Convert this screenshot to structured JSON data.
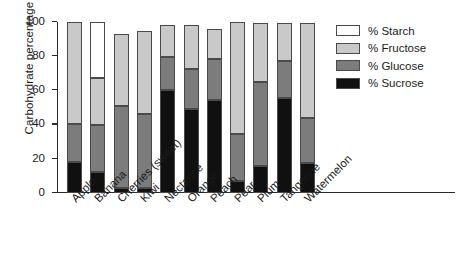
{
  "chart_data": {
    "type": "bar",
    "subtype": "stacked-bar",
    "title": "",
    "xlabel": "",
    "ylabel": "Carbohydrate percentage",
    "ylim": [
      0,
      100
    ],
    "yticks": [
      0,
      20,
      40,
      60,
      80,
      100
    ],
    "ytick_labels": [
      "0",
      "20",
      "40",
      "60",
      "80",
      "100"
    ],
    "grid": false,
    "legend_position": "right",
    "categories": [
      "Apple",
      "Banana",
      "Cherries (sweet)",
      "Kiwi",
      "Nectarine",
      "Orange",
      "Peach",
      "Pear",
      "Plum",
      "Tangerine",
      "Watermelon"
    ],
    "series": [
      {
        "name": "% Sucrose",
        "color": "#101010",
        "values": [
          18,
          12,
          3,
          3,
          60.5,
          49,
          54.5,
          7,
          16,
          55.5,
          17.5
        ]
      },
      {
        "name": "% Glucose",
        "color": "#7c7c7c",
        "values": [
          22.5,
          27.5,
          48,
          43,
          19,
          23.5,
          24,
          27.5,
          49,
          21.5,
          26.5
        ]
      },
      {
        "name": "% Fructose",
        "color": "#c9c9c9",
        "values": [
          59.5,
          27.5,
          42,
          48.5,
          19,
          26,
          17.5,
          65.5,
          34.5,
          22.5,
          55.5
        ]
      },
      {
        "name": "% Starch",
        "color": "#ffffff",
        "values": [
          0,
          33,
          0,
          0,
          0,
          0,
          0,
          0,
          0,
          0,
          0
        ]
      }
    ],
    "cumulative_tops": {
      "Apple": {
        "sucrose": 18,
        "glucose": 40.5,
        "fructose": 100,
        "starch": 100
      },
      "Banana": {
        "sucrose": 12,
        "glucose": 39.5,
        "fructose": 67,
        "starch": 100
      },
      "Cherries (sweet)": {
        "sucrose": 3,
        "glucose": 51,
        "fructose": 93,
        "starch": 93
      },
      "Kiwi": {
        "sucrose": 3,
        "glucose": 46,
        "fructose": 94.5,
        "starch": 94.5
      },
      "Nectarine": {
        "sucrose": 60.5,
        "glucose": 79.5,
        "fructose": 98.5,
        "starch": 98.5
      },
      "Orange": {
        "sucrose": 49,
        "glucose": 72.5,
        "fructose": 98.5,
        "starch": 98.5
      },
      "Peach": {
        "sucrose": 54.5,
        "glucose": 78.5,
        "fructose": 96,
        "starch": 96
      },
      "Pear": {
        "sucrose": 7,
        "glucose": 34.5,
        "fructose": 100,
        "starch": 100
      },
      "Plum": {
        "sucrose": 16,
        "glucose": 65,
        "fructose": 99.5,
        "starch": 99.5
      },
      "Tangerine": {
        "sucrose": 55.5,
        "glucose": 77,
        "fructose": 99.5,
        "starch": 99.5
      },
      "Watermelon": {
        "sucrose": 17.5,
        "glucose": 44,
        "fructose": 99.5,
        "starch": 99.5
      }
    }
  },
  "legend": {
    "items": [
      {
        "label": "% Starch",
        "color": "#ffffff"
      },
      {
        "label": "% Fructose",
        "color": "#c9c9c9"
      },
      {
        "label": "% Glucose",
        "color": "#7c7c7c"
      },
      {
        "label": "% Sucrose",
        "color": "#101010"
      }
    ]
  },
  "colors": {
    "starch": "#ffffff",
    "fructose": "#c9c9c9",
    "glucose": "#7c7c7c",
    "sucrose": "#101010",
    "axis": "#2a2a2a",
    "text": "#1a1a1a",
    "background": "#ffffff"
  }
}
